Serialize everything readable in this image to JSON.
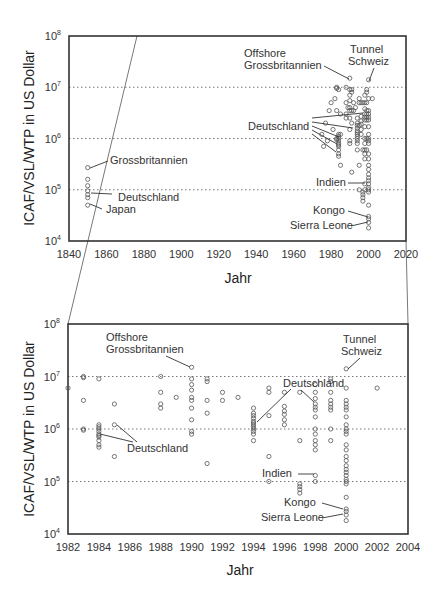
{
  "chart_data": [
    {
      "type": "scatter",
      "title": "",
      "xlabel": "Jahr",
      "ylabel": "ICAF/VSL/WTP in US Dollar",
      "xlim": [
        1840,
        2020
      ],
      "ylim": [
        10000,
        100000000
      ],
      "yscale": "log",
      "xticks": [
        "1840",
        "1860",
        "1880",
        "1900",
        "1920",
        "1940",
        "1960",
        "1980",
        "2000",
        "2020"
      ],
      "yticks": [
        "10^4",
        "10^5",
        "10^6",
        "10^7",
        "10^8"
      ],
      "grid": "horizontal dotted at 10^5, 10^6, 10^7",
      "annotations": [
        {
          "text": "Grossbritannien",
          "x": 1850,
          "y": 270000
        },
        {
          "text": "Deutschland",
          "x": 1850,
          "y": 80000
        },
        {
          "text": "Japan",
          "x": 1850,
          "y": 50000
        },
        {
          "text": "Offshore Grossbritannien",
          "x": 1990,
          "y": 15000000
        },
        {
          "text": "Tunnel Schweiz",
          "x": 2000,
          "y": 14000000
        },
        {
          "text": "Deutschland",
          "x": 1984,
          "y": 1000000
        },
        {
          "text": "Indien",
          "x": 1998,
          "y": 130000
        },
        {
          "text": "Kongo",
          "x": 2000,
          "y": 28000
        },
        {
          "text": "Sierra Leone",
          "x": 2000,
          "y": 23000
        }
      ],
      "series": [
        {
          "name": "1850 estimates",
          "x": [
            1850,
            1850,
            1850,
            1850,
            1850,
            1850,
            1850
          ],
          "y": [
            270000,
            160000,
            120000,
            95000,
            80000,
            70000,
            50000
          ]
        },
        {
          "name": "1975-2002 estimates",
          "x": [
            1976,
            1978,
            1980,
            1983,
            1984,
            1985,
            1987,
            1990,
            1991,
            1994,
            1995,
            1997,
            1998,
            1999,
            2000,
            2001,
            2002
          ],
          "y": [
            700000,
            900000,
            3000000,
            9000000,
            1000000,
            1200000,
            4000000,
            15000000,
            8000000,
            1500000,
            4000000,
            5000000,
            3000000,
            6000000,
            14000000,
            3000000,
            6000000
          ]
        }
      ]
    },
    {
      "type": "scatter",
      "title": "",
      "xlabel": "Jahr",
      "ylabel": "ICAF/VSL/WTP in US Dollar",
      "xlim": [
        1982,
        2004
      ],
      "ylim": [
        10000,
        100000000
      ],
      "yscale": "log",
      "xticks": [
        "1982",
        "1984",
        "1986",
        "1988",
        "1990",
        "1992",
        "1994",
        "1996",
        "1998",
        "2000",
        "2002",
        "2004"
      ],
      "yticks": [
        "10^4",
        "10^5",
        "10^6",
        "10^7",
        "10^8"
      ],
      "grid": "horizontal dotted at 10^5, 10^6, 10^7",
      "annotations": [
        {
          "text": "Offshore Grossbritannien",
          "x": 1990,
          "y": 15000000
        },
        {
          "text": "Tunnel Schweiz",
          "x": 2000,
          "y": 14000000
        },
        {
          "text": "Deutschland",
          "x": 1984,
          "y": 750000
        },
        {
          "text": "Deutschland",
          "x": 1985,
          "y": 1200000
        },
        {
          "text": "Deutschland",
          "x": 1994,
          "y": 1300000
        },
        {
          "text": "Deutschland",
          "x": 1998,
          "y": 3000000
        },
        {
          "text": "Indien",
          "x": 1998,
          "y": 130000
        },
        {
          "text": "Kongo",
          "x": 2000,
          "y": 28000
        },
        {
          "text": "Sierra Leone",
          "x": 2000,
          "y": 23000
        }
      ],
      "points": [
        [
          1982,
          6000000
        ],
        [
          1983,
          10000000
        ],
        [
          1983,
          9500000
        ],
        [
          1983,
          3500000
        ],
        [
          1983,
          1000000
        ],
        [
          1983,
          950000
        ],
        [
          1984,
          9000000
        ],
        [
          1984,
          1200000
        ],
        [
          1984,
          1100000
        ],
        [
          1984,
          1000000
        ],
        [
          1984,
          900000
        ],
        [
          1984,
          800000
        ],
        [
          1984,
          750000
        ],
        [
          1984,
          700000
        ],
        [
          1984,
          600000
        ],
        [
          1984,
          500000
        ],
        [
          1984,
          450000
        ],
        [
          1985,
          3000000
        ],
        [
          1985,
          1200000
        ],
        [
          1985,
          300000
        ],
        [
          1988,
          10000000
        ],
        [
          1988,
          5000000
        ],
        [
          1988,
          3000000
        ],
        [
          1988,
          2500000
        ],
        [
          1989,
          4000000
        ],
        [
          1990,
          15000000
        ],
        [
          1990,
          9000000
        ],
        [
          1990,
          7000000
        ],
        [
          1990,
          5500000
        ],
        [
          1990,
          4000000
        ],
        [
          1990,
          3500000
        ],
        [
          1990,
          2500000
        ],
        [
          1990,
          1500000
        ],
        [
          1990,
          900000
        ],
        [
          1990,
          800000
        ],
        [
          1991,
          9000000
        ],
        [
          1991,
          8000000
        ],
        [
          1991,
          3500000
        ],
        [
          1991,
          2000000
        ],
        [
          1991,
          220000
        ],
        [
          1992,
          5000000
        ],
        [
          1992,
          3500000
        ],
        [
          1993,
          4000000
        ],
        [
          1994,
          2500000
        ],
        [
          1994,
          2000000
        ],
        [
          1994,
          1800000
        ],
        [
          1994,
          1600000
        ],
        [
          1994,
          1400000
        ],
        [
          1994,
          1300000
        ],
        [
          1994,
          1200000
        ],
        [
          1994,
          1100000
        ],
        [
          1994,
          1000000
        ],
        [
          1994,
          900000
        ],
        [
          1994,
          800000
        ],
        [
          1994,
          600000
        ],
        [
          1995,
          6000000
        ],
        [
          1995,
          5000000
        ],
        [
          1995,
          1800000
        ],
        [
          1995,
          300000
        ],
        [
          1995,
          100000
        ],
        [
          1996,
          5000000
        ],
        [
          1996,
          2700000
        ],
        [
          1996,
          2200000
        ],
        [
          1996,
          1900000
        ],
        [
          1996,
          1500000
        ],
        [
          1996,
          1200000
        ],
        [
          1997,
          5000000
        ],
        [
          1997,
          600000
        ],
        [
          1997,
          90000
        ],
        [
          1997,
          80000
        ],
        [
          1997,
          70000
        ],
        [
          1997,
          60000
        ],
        [
          1998,
          7000000
        ],
        [
          1998,
          5000000
        ],
        [
          1998,
          3800000
        ],
        [
          1998,
          3000000
        ],
        [
          1998,
          2600000
        ],
        [
          1998,
          2300000
        ],
        [
          1998,
          1700000
        ],
        [
          1998,
          1000000
        ],
        [
          1998,
          800000
        ],
        [
          1998,
          600000
        ],
        [
          1998,
          500000
        ],
        [
          1998,
          400000
        ],
        [
          1998,
          130000
        ],
        [
          1998,
          100000
        ],
        [
          1999,
          9000000
        ],
        [
          1999,
          8000000
        ],
        [
          1999,
          5000000
        ],
        [
          1999,
          3500000
        ],
        [
          1999,
          3000000
        ],
        [
          1999,
          2600000
        ],
        [
          1999,
          2300000
        ],
        [
          1999,
          1000000
        ],
        [
          1999,
          600000
        ],
        [
          2000,
          14000000
        ],
        [
          2000,
          6000000
        ],
        [
          2000,
          3500000
        ],
        [
          2000,
          3000000
        ],
        [
          2000,
          2600000
        ],
        [
          2000,
          2300000
        ],
        [
          2000,
          1700000
        ],
        [
          2000,
          1200000
        ],
        [
          2000,
          1000000
        ],
        [
          2000,
          900000
        ],
        [
          2000,
          800000
        ],
        [
          2000,
          500000
        ],
        [
          2000,
          400000
        ],
        [
          2000,
          300000
        ],
        [
          2000,
          250000
        ],
        [
          2000,
          200000
        ],
        [
          2000,
          170000
        ],
        [
          2000,
          150000
        ],
        [
          2000,
          130000
        ],
        [
          2000,
          110000
        ],
        [
          2000,
          100000
        ],
        [
          2000,
          90000
        ],
        [
          2000,
          50000
        ],
        [
          2000,
          30000
        ],
        [
          2000,
          27000
        ],
        [
          2000,
          23000
        ],
        [
          2000,
          18000
        ],
        [
          2002,
          6000000
        ]
      ]
    }
  ],
  "labels": {
    "ylabel": "ICAF/VSL/WTP in US Dollar",
    "xlabel": "Jahr",
    "grossbritannien": "Grossbritannien",
    "deutschland": "Deutschland",
    "japan": "Japan",
    "offshore": "Offshore",
    "offshore2": "Grossbritannien",
    "tunnel": "Tunnel",
    "schweiz": "Schweiz",
    "indien": "Indien",
    "kongo": "Kongo",
    "sierra": "Sierra Leone"
  },
  "ticks": {
    "top_x": [
      "1840",
      "1860",
      "1880",
      "1900",
      "1920",
      "1940",
      "1960",
      "1980",
      "2000",
      "2020"
    ],
    "bottom_x": [
      "1982",
      "1984",
      "1986",
      "1988",
      "1990",
      "1992",
      "1994",
      "1996",
      "1998",
      "2000",
      "2002",
      "2004"
    ],
    "y_base": "10",
    "y_exp": [
      "8",
      "7",
      "6",
      "5",
      "4"
    ]
  }
}
